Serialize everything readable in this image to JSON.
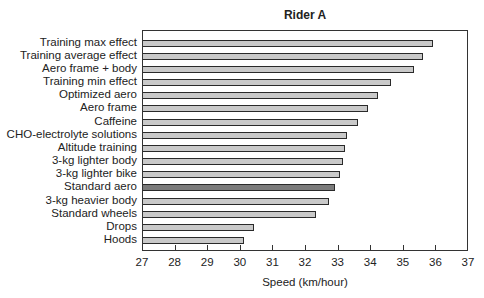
{
  "chart_data": {
    "type": "bar",
    "orientation": "horizontal",
    "title": "Rider A",
    "xlabel": "Speed (km/hour)",
    "ylabel": "",
    "xlim": [
      27,
      37
    ],
    "xticks": [
      27,
      28,
      29,
      30,
      31,
      32,
      33,
      34,
      35,
      36,
      37
    ],
    "grid": false,
    "legend": null,
    "categories": [
      "Training max effect",
      "Training average effect",
      "Aero frame + body",
      "Training min effect",
      "Optimized aero",
      "Aero frame",
      "Caffeine",
      "CHO-electrolyte solutions",
      "Altitude training",
      "3-kg lighter body",
      "3-kg lighter bike",
      "Standard aero",
      "3-kg heavier body",
      "Standard wheels",
      "Drops",
      "Hoods"
    ],
    "values": [
      35.9,
      35.6,
      35.3,
      34.6,
      34.2,
      33.9,
      33.6,
      33.25,
      33.2,
      33.15,
      33.05,
      32.9,
      32.7,
      32.3,
      30.4,
      30.1
    ],
    "highlighted": "Standard aero",
    "colors": {
      "bar": "#c9c9c9",
      "highlight": "#7b7b7b",
      "border": "#2a2a2a"
    }
  }
}
